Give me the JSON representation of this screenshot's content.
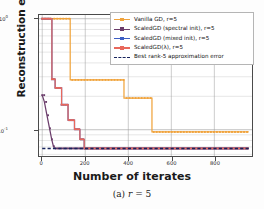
{
  "figure": {
    "caption_prefix": "(a)",
    "caption_var": "r",
    "caption_eq": "= 5"
  },
  "chart_data": {
    "type": "line",
    "title": "",
    "xlabel": "Number of iterates",
    "ylabel": "Reconstruction error",
    "yscale": "log",
    "xlim": [
      -15,
      975
    ],
    "ylim": [
      0.058,
      1.08
    ],
    "grid": true,
    "grid_style": "both-axes-light",
    "legend_position": "upper-right",
    "xticks": [
      0,
      200,
      400,
      600,
      800
    ],
    "xticklabels": [
      "0",
      "200",
      "400",
      "600",
      "800"
    ],
    "yticks": [
      1,
      0.1
    ],
    "yticklabels": [
      "10^0",
      "10^-1"
    ],
    "yticklabel_base": "10",
    "yticklabel_exp": [
      "0",
      "-1"
    ],
    "series": [
      {
        "name": "Vanilla GD, r=5",
        "color": "#f0a33c",
        "marker": "square",
        "linestyle": "solid",
        "x": [
          0,
          130,
          130,
          380,
          380,
          510,
          510,
          960
        ],
        "y": [
          1.0,
          1.0,
          0.281,
          0.281,
          0.193,
          0.193,
          0.0955,
          0.0955
        ]
      },
      {
        "name": "ScaledGD (spectral init), r=5",
        "color": "#6b3d6b",
        "marker": "square",
        "linestyle": "solid",
        "x": [
          0,
          10,
          22,
          34,
          44,
          52,
          58,
          960
        ],
        "y": [
          0.205,
          0.178,
          0.135,
          0.103,
          0.082,
          0.071,
          0.0678,
          0.0678
        ]
      },
      {
        "name": "ScaledGD (mixed init), r=5",
        "color": "#3d5fc4",
        "marker": "square",
        "linestyle": "solid",
        "x": [
          0,
          45,
          45,
          60,
          60,
          90,
          90,
          120,
          120,
          150,
          150,
          175,
          175,
          195,
          195,
          960
        ],
        "y": [
          1.0,
          1.0,
          0.285,
          0.285,
          0.238,
          0.238,
          0.168,
          0.168,
          0.122,
          0.122,
          0.101,
          0.101,
          0.082,
          0.082,
          0.0678,
          0.0678
        ]
      },
      {
        "name": "ScaledGD(λ), r=5",
        "color": "#e8685c",
        "marker": "square",
        "linestyle": "solid",
        "x": [
          0,
          45,
          45,
          60,
          60,
          90,
          90,
          120,
          120,
          150,
          150,
          175,
          175,
          195,
          195,
          960
        ],
        "y": [
          1.0,
          1.0,
          0.285,
          0.285,
          0.238,
          0.238,
          0.168,
          0.168,
          0.122,
          0.122,
          0.101,
          0.101,
          0.082,
          0.082,
          0.0678,
          0.0678
        ]
      },
      {
        "name": "Best rank-5 approximation error",
        "color": "#17235c",
        "marker": "none",
        "linestyle": "dashed",
        "x": [
          0,
          960
        ],
        "y": [
          0.0678,
          0.0678
        ]
      }
    ]
  },
  "legend": {
    "entries": [
      {
        "label": "Vanilla GD, r=5",
        "color": "#f0a33c",
        "style": "solid-marker"
      },
      {
        "label": "ScaledGD (spectral init), r=5",
        "color": "#6b3d6b",
        "style": "solid-marker"
      },
      {
        "label": "ScaledGD (mixed init), r=5",
        "color": "#3d5fc4",
        "style": "solid-marker"
      },
      {
        "label": "ScaledGD(λ), r=5",
        "color": "#e8685c",
        "style": "solid-marker"
      },
      {
        "label": "Best rank-5 approximation error",
        "color": "#17235c",
        "style": "dashed"
      }
    ]
  }
}
